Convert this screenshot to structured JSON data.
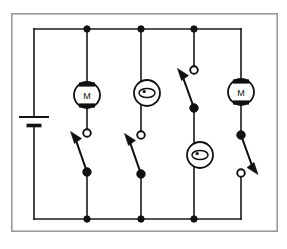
{
  "diagram": {
    "kind": "electrical-schematic",
    "colors": {
      "wire": "#1a1a1a",
      "frame": "#9a9a9a",
      "background": "#ffffff",
      "node_fill": "#111111",
      "node_open_fill": "#ffffff"
    }
  },
  "frame": {
    "x": 11,
    "y": 13,
    "width": 267,
    "height": 219
  },
  "rails": {
    "top_y": 29,
    "bottom_y": 219,
    "left_x": 34,
    "right_x": 241
  },
  "power_source": {
    "label": "battery",
    "symbol": "battery-cell",
    "x": 34,
    "positive_plate_y": 117,
    "negative_plate_y": 126,
    "positive_plate_width": 30,
    "negative_plate_width": 15
  },
  "branches": [
    {
      "id": "branch-1",
      "x": 87,
      "device": {
        "type": "motor",
        "label": "M",
        "cy": 95,
        "r": 13
      },
      "switch": {
        "type": "switch-open",
        "orientation": "terminal-top",
        "terminal_y": 133,
        "pivot_y": 172,
        "lever_tip_x": 73,
        "lever_tip_y": 136
      },
      "top_node": true,
      "bottom_node": true
    },
    {
      "id": "branch-2",
      "x": 141,
      "device": {
        "type": "indicator-lamp",
        "label": "",
        "cy": 93,
        "r": 13
      },
      "switch": {
        "type": "switch-open",
        "orientation": "terminal-top",
        "terminal_y": 135,
        "pivot_y": 174,
        "lever_tip_x": 127,
        "lever_tip_y": 138
      },
      "top_node": true,
      "bottom_node": true
    },
    {
      "id": "branch-3",
      "x": 194,
      "device": {
        "type": "indicator-lamp",
        "label": "",
        "cy": 155,
        "r": 13
      },
      "switch": {
        "type": "switch-open",
        "orientation": "terminal-top",
        "terminal_y": 70,
        "pivot_y": 108,
        "lever_tip_x": 180,
        "lever_tip_y": 73
      },
      "top_node": true,
      "bottom_node": true
    },
    {
      "id": "branch-4",
      "x": 241,
      "device": {
        "type": "motor",
        "label": "M",
        "cy": 92,
        "r": 13
      },
      "switch": {
        "type": "switch-open",
        "orientation": "pivot-top",
        "pivot_y": 135,
        "terminal_y": 173,
        "lever_tip_x": 256,
        "lever_tip_y": 170
      },
      "top_node": false,
      "bottom_node": false
    }
  ],
  "junction_nodes": {
    "top": [
      87,
      141,
      194
    ],
    "bottom": [
      87,
      141,
      194
    ],
    "radius": 3.2
  },
  "legend": {
    "motor_label": "M",
    "lamp_label": "",
    "battery_label": ""
  }
}
